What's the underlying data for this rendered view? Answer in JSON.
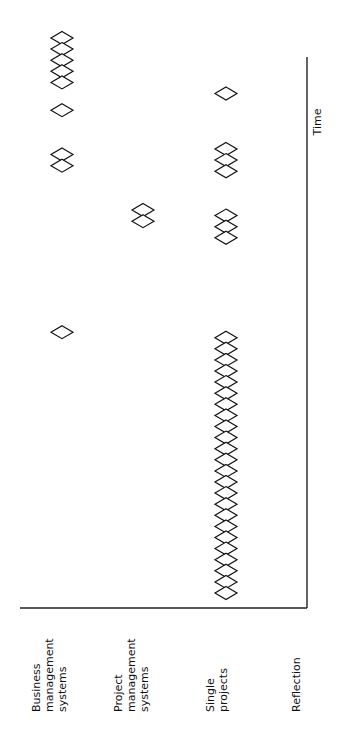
{
  "diagram": {
    "axis_label": "Time",
    "rows": [
      {
        "id": "business",
        "label_lines": [
          "Business",
          "management",
          "systems"
        ],
        "groups": [
          {
            "start": 0,
            "count": 5
          },
          {
            "start": 6.5,
            "count": 1
          },
          {
            "start": 10.5,
            "count": 2
          },
          {
            "start": 26.5,
            "count": 1
          }
        ]
      },
      {
        "id": "project",
        "label_lines": [
          "Project",
          "management",
          "systems"
        ],
        "groups": [
          {
            "start": 15.5,
            "count": 2
          }
        ]
      },
      {
        "id": "single",
        "label_lines": [
          "Single",
          "projects"
        ],
        "groups": [
          {
            "start": 5,
            "count": 1
          },
          {
            "start": 10,
            "count": 3
          },
          {
            "start": 16,
            "count": 3
          },
          {
            "start": 27,
            "count": 24
          }
        ]
      },
      {
        "id": "reflection",
        "label_lines": [
          "Reflection"
        ],
        "groups": []
      }
    ]
  }
}
